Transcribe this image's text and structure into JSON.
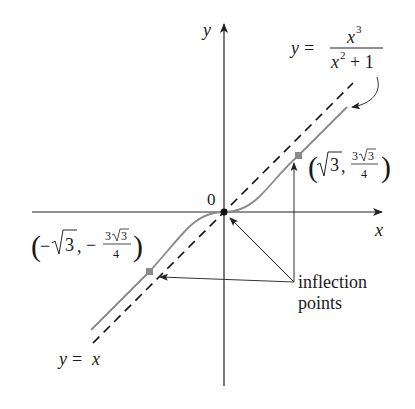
{
  "figure": {
    "type": "function-graph",
    "function_label": {
      "lhs": "y =",
      "numerator_base": "x",
      "numerator_exp": "3",
      "denominator_base": "x",
      "denominator_exp": "2",
      "denominator_rest": "+ 1"
    },
    "asymptote_label": {
      "lhs": "y",
      "eq": "=",
      "rhs": "x"
    },
    "axes": {
      "x_label": "x",
      "y_label": "y",
      "origin_label": "0"
    },
    "inflection_points": {
      "label_line1": "inflection",
      "label_line2": "points",
      "right": {
        "open": "(",
        "x_sqrt_num": "3",
        "comma": ",",
        "frac_num_coef": "3",
        "frac_num_sqrt": "3",
        "frac_den": "4",
        "close": ")"
      },
      "left": {
        "open": "(",
        "x_sign": "−",
        "x_sqrt_num": "3",
        "comma": ",",
        "frac_sign": "−",
        "frac_num_coef": "3",
        "frac_num_sqrt": "3",
        "frac_den": "4",
        "close": ")"
      }
    },
    "colors": {
      "curve": "#8a8a8a",
      "axes": "#222222",
      "asymptote": "#111111",
      "point": "#8a8a8a",
      "pointer": "#333333"
    }
  }
}
